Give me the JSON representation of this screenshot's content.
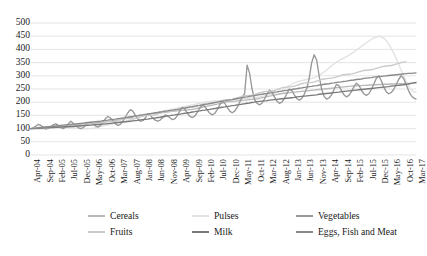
{
  "chart_data": {
    "type": "line",
    "title": "",
    "subtitle": "",
    "xlabel": "",
    "ylabel": "",
    "ylim": [
      0,
      500
    ],
    "ytick_step": 50,
    "yticks": [
      0,
      50,
      100,
      150,
      200,
      250,
      300,
      350,
      400,
      450,
      500
    ],
    "grid": true,
    "grid_axis": "y",
    "legend_position": "bottom",
    "x_tick_step_months": 5,
    "x_tick_labels": [
      "Apr-04",
      "Sep-04",
      "Feb-05",
      "Jul-05",
      "Dec-05",
      "May-06",
      "Oct-06",
      "Mar-07",
      "Aug-07",
      "Jan-08",
      "Jun-08",
      "Nov-08",
      "Apr-09",
      "Sep-09",
      "Feb-10",
      "Jul-10",
      "Dec-10",
      "May-11",
      "Oct-11",
      "Mar-12",
      "Aug-12",
      "Jan-13",
      "Jun-13",
      "Nov-13",
      "Apr-14",
      "Sep-14",
      "Feb-15",
      "Jul-15",
      "Dec-15",
      "May-16",
      "Oct-16",
      "Mar-17"
    ],
    "x_start": "Apr-04",
    "x_end": "Mar-17",
    "n_points": 156,
    "series": [
      {
        "name": "Cereals",
        "color": "#b9b9b9",
        "values": [
          100,
          101,
          102,
          103,
          103,
          104,
          105,
          105,
          106,
          106,
          107,
          108,
          109,
          110,
          111,
          112,
          113,
          113,
          114,
          115,
          116,
          117,
          118,
          119,
          120,
          120,
          121,
          122,
          123,
          124,
          125,
          127,
          128,
          130,
          131,
          133,
          134,
          136,
          138,
          140,
          142,
          144,
          146,
          148,
          150,
          152,
          153,
          155,
          156,
          157,
          158,
          159,
          160,
          161,
          162,
          163,
          164,
          165,
          166,
          167,
          168,
          169,
          170,
          171,
          172,
          173,
          175,
          177,
          179,
          181,
          183,
          185,
          187,
          189,
          191,
          193,
          195,
          197,
          199,
          201,
          202,
          203,
          204,
          205,
          206,
          207,
          208,
          209,
          210,
          211,
          212,
          213,
          215,
          217,
          219,
          221,
          223,
          225,
          227,
          229,
          231,
          233,
          234,
          235,
          236,
          237,
          238,
          239,
          240,
          241,
          242,
          243,
          244,
          245,
          246,
          247,
          248,
          249,
          250,
          251,
          252,
          253,
          254,
          255,
          256,
          257,
          258,
          259,
          260,
          261,
          262,
          262,
          263,
          263,
          264,
          264,
          265,
          265,
          266,
          266,
          267,
          267,
          268,
          268,
          268,
          269,
          269,
          269,
          270,
          270,
          270,
          271,
          271,
          271,
          272,
          272
        ]
      },
      {
        "name": "Pulses",
        "color": "#e2e2e2",
        "values": [
          100,
          99,
          98,
          97,
          98,
          99,
          101,
          103,
          105,
          106,
          107,
          108,
          108,
          107,
          106,
          105,
          104,
          103,
          102,
          101,
          100,
          99,
          99,
          100,
          101,
          102,
          104,
          106,
          108,
          110,
          112,
          114,
          116,
          118,
          120,
          122,
          124,
          126,
          128,
          130,
          133,
          136,
          139,
          142,
          145,
          148,
          151,
          154,
          156,
          158,
          160,
          162,
          164,
          166,
          168,
          170,
          172,
          174,
          176,
          178,
          180,
          182,
          184,
          186,
          188,
          190,
          192,
          194,
          196,
          198,
          200,
          202,
          203,
          204,
          205,
          205,
          206,
          206,
          207,
          207,
          208,
          209,
          210,
          211,
          212,
          213,
          214,
          215,
          216,
          217,
          218,
          219,
          220,
          222,
          224,
          226,
          228,
          230,
          233,
          236,
          240,
          245,
          250,
          256,
          262,
          268,
          273,
          277,
          280,
          282,
          284,
          286,
          288,
          290,
          293,
          297,
          302,
          308,
          315,
          322,
          330,
          338,
          345,
          352,
          358,
          363,
          368,
          373,
          378,
          384,
          390,
          397,
          404,
          411,
          418,
          425,
          432,
          438,
          443,
          447,
          450,
          448,
          442,
          433,
          420,
          404,
          386,
          366,
          345,
          322,
          300,
          280,
          262,
          248,
          240,
          237
        ]
      },
      {
        "name": "Vegetables",
        "color": "#989898",
        "values": [
          100,
          104,
          110,
          116,
          112,
          104,
          98,
          102,
          108,
          114,
          118,
          112,
          104,
          100,
          106,
          118,
          128,
          120,
          110,
          104,
          100,
          104,
          112,
          120,
          124,
          118,
          110,
          106,
          112,
          124,
          138,
          146,
          140,
          128,
          118,
          112,
          116,
          128,
          144,
          160,
          172,
          166,
          150,
          136,
          128,
          130,
          140,
          156,
          150,
          140,
          132,
          128,
          132,
          142,
          152,
          148,
          140,
          134,
          138,
          150,
          168,
          180,
          172,
          158,
          146,
          142,
          148,
          162,
          178,
          190,
          184,
          170,
          158,
          152,
          158,
          172,
          190,
          204,
          196,
          180,
          166,
          160,
          166,
          180,
          200,
          218,
          232,
          340,
          310,
          250,
          210,
          196,
          190,
          196,
          212,
          230,
          246,
          238,
          220,
          204,
          196,
          200,
          214,
          232,
          250,
          244,
          228,
          214,
          208,
          214,
          230,
          252,
          290,
          350,
          380,
          360,
          300,
          250,
          222,
          212,
          216,
          228,
          248,
          268,
          262,
          244,
          228,
          220,
          226,
          240,
          258,
          272,
          264,
          246,
          232,
          226,
          232,
          248,
          268,
          290,
          300,
          282,
          258,
          240,
          232,
          236,
          248,
          266,
          286,
          300,
          290,
          268,
          244,
          226,
          216,
          212
        ]
      },
      {
        "name": "Fruits",
        "color": "#c9c9c9",
        "values": [
          100,
          101,
          103,
          105,
          104,
          102,
          101,
          102,
          104,
          106,
          107,
          106,
          105,
          106,
          108,
          110,
          112,
          113,
          112,
          111,
          112,
          114,
          116,
          118,
          119,
          118,
          117,
          118,
          120,
          123,
          126,
          128,
          127,
          126,
          127,
          130,
          133,
          136,
          138,
          139,
          138,
          137,
          138,
          141,
          144,
          147,
          149,
          150,
          150,
          151,
          153,
          156,
          159,
          162,
          164,
          165,
          165,
          166,
          168,
          171,
          174,
          177,
          179,
          180,
          180,
          181,
          183,
          186,
          189,
          192,
          194,
          195,
          195,
          196,
          198,
          201,
          204,
          207,
          209,
          210,
          210,
          211,
          213,
          216,
          219,
          222,
          224,
          225,
          226,
          227,
          229,
          232,
          235,
          238,
          240,
          241,
          242,
          243,
          245,
          248,
          251,
          254,
          256,
          257,
          258,
          259,
          261,
          264,
          267,
          270,
          272,
          273,
          274,
          275,
          277,
          280,
          283,
          286,
          288,
          289,
          290,
          291,
          293,
          296,
          299,
          302,
          304,
          305,
          306,
          307,
          309,
          312,
          315,
          318,
          320,
          321,
          322,
          323,
          325,
          328,
          331,
          334,
          336,
          337,
          338,
          339,
          341,
          344,
          347,
          350,
          352,
          353
        ]
      },
      {
        "name": "Milk",
        "color": "#7a7a7a",
        "values": [
          100,
          100,
          101,
          101,
          102,
          102,
          103,
          103,
          104,
          104,
          105,
          105,
          106,
          106,
          107,
          107,
          108,
          108,
          109,
          110,
          110,
          111,
          112,
          112,
          113,
          114,
          115,
          115,
          116,
          117,
          118,
          119,
          120,
          121,
          122,
          123,
          124,
          125,
          126,
          127,
          128,
          129,
          130,
          131,
          133,
          134,
          135,
          136,
          138,
          139,
          140,
          142,
          143,
          145,
          146,
          148,
          149,
          151,
          152,
          154,
          155,
          157,
          158,
          160,
          161,
          163,
          164,
          166,
          167,
          169,
          170,
          172,
          173,
          175,
          176,
          178,
          179,
          181,
          182,
          184,
          185,
          187,
          188,
          190,
          191,
          193,
          194,
          196,
          197,
          199,
          200,
          202,
          203,
          204,
          205,
          206,
          208,
          209,
          210,
          211,
          212,
          213,
          214,
          215,
          216,
          217,
          218,
          220,
          221,
          222,
          223,
          224,
          225,
          226,
          227,
          228,
          230,
          231,
          232,
          233,
          234,
          235,
          236,
          237,
          238,
          240,
          241,
          242,
          243,
          244,
          245,
          246,
          247,
          248,
          249,
          250,
          251,
          252,
          253,
          254,
          255,
          256,
          257,
          258,
          259,
          261,
          262,
          263,
          264,
          265,
          266,
          268,
          269,
          271,
          273,
          275
        ]
      },
      {
        "name": "Eggs, Fish and Meat",
        "color": "#8a8a8a",
        "values": [
          100,
          101,
          102,
          103,
          104,
          105,
          106,
          107,
          108,
          109,
          110,
          111,
          112,
          113,
          114,
          115,
          116,
          117,
          118,
          119,
          120,
          121,
          122,
          123,
          124,
          125,
          126,
          127,
          128,
          130,
          131,
          132,
          134,
          135,
          136,
          138,
          139,
          140,
          142,
          143,
          145,
          146,
          148,
          149,
          151,
          152,
          154,
          155,
          157,
          158,
          160,
          161,
          163,
          164,
          166,
          167,
          169,
          170,
          172,
          173,
          175,
          177,
          178,
          180,
          182,
          183,
          185,
          187,
          188,
          190,
          192,
          193,
          195,
          197,
          199,
          200,
          202,
          204,
          205,
          207,
          209,
          210,
          212,
          214,
          215,
          217,
          219,
          220,
          222,
          224,
          225,
          227,
          229,
          230,
          232,
          233,
          235,
          236,
          238,
          239,
          241,
          242,
          244,
          245,
          247,
          248,
          250,
          251,
          253,
          254,
          256,
          257,
          259,
          260,
          262,
          263,
          265,
          266,
          268,
          269,
          270,
          272,
          273,
          275,
          276,
          277,
          279,
          280,
          282,
          283,
          284,
          286,
          287,
          288,
          290,
          291,
          292,
          293,
          295,
          296,
          297,
          298,
          299,
          300,
          301,
          302,
          303,
          304,
          305,
          306,
          307,
          308,
          309,
          309,
          310,
          311
        ]
      }
    ]
  },
  "legend": {
    "items": [
      {
        "label": "Cereals"
      },
      {
        "label": "Pulses"
      },
      {
        "label": "Vegetables"
      },
      {
        "label": "Fruits"
      },
      {
        "label": "Milk"
      },
      {
        "label": "Eggs, Fish and Meat"
      }
    ]
  }
}
